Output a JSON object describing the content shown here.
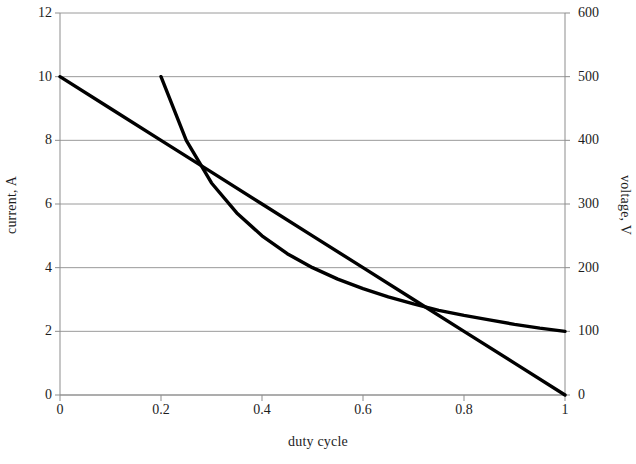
{
  "chart_data": {
    "type": "line",
    "title": "",
    "xlabel": "duty cycle",
    "ylabel": "current, A",
    "y2label": "voltage, V",
    "xlim": [
      0,
      1
    ],
    "ylim": [
      0,
      12
    ],
    "y2lim": [
      0,
      600
    ],
    "xticks": [
      "0",
      "0.2",
      "0.4",
      "0.6",
      "0.8",
      "1"
    ],
    "xtick_values": [
      0,
      0.2,
      0.4,
      0.6,
      0.8,
      1
    ],
    "yticks": [
      "0",
      "2",
      "4",
      "6",
      "8",
      "10",
      "12"
    ],
    "ytick_values": [
      0,
      2,
      4,
      6,
      8,
      10,
      12
    ],
    "y2ticks": [
      "0",
      "100",
      "200",
      "300",
      "400",
      "500",
      "600"
    ],
    "y2tick_values": [
      0,
      100,
      200,
      300,
      400,
      500,
      600
    ],
    "grid": "horizontal",
    "legend": "none",
    "line_color": "#000000",
    "grid_color": "#9a9a9a",
    "axis_color": "#8d8d8d",
    "series": [
      {
        "name": "current",
        "axis": "left",
        "shape": "straight",
        "x": [
          0,
          0.1,
          0.2,
          0.3,
          0.4,
          0.5,
          0.6,
          0.7,
          0.8,
          0.9,
          1
        ],
        "values": [
          10,
          9,
          8,
          7,
          6,
          5,
          4,
          3,
          2,
          1,
          0
        ]
      },
      {
        "name": "voltage",
        "axis": "right",
        "shape": "curve",
        "x": [
          0.2,
          0.25,
          0.3,
          0.35,
          0.4,
          0.45,
          0.5,
          0.55,
          0.6,
          0.65,
          0.7,
          0.75,
          0.8,
          0.85,
          0.9,
          0.95,
          1
        ],
        "values": [
          500,
          400,
          333,
          286,
          250,
          222,
          200,
          182,
          167,
          154,
          143,
          133,
          125,
          118,
          111,
          105,
          100
        ]
      }
    ],
    "intersections": [
      {
        "x": 0.27,
        "current": 7.3,
        "voltage": 365
      },
      {
        "x": 0.715,
        "current": 2.85,
        "voltage": 143
      }
    ]
  }
}
